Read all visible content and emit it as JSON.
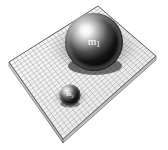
{
  "figure": {
    "background_color": "#ffffff",
    "grid_line_color": "#8a8a8a",
    "grid_fill_color": "#f2f2f2",
    "plane_edge_color": "#4a4a4a",
    "slab_side_color": "#c9c9c9",
    "shadow_color": "#9a9a9a"
  },
  "plane": {
    "name": "spacetime-grid",
    "corners": {
      "top": [
        98,
        6
      ],
      "right": [
        156,
        56
      ],
      "bottom": [
        63,
        139
      ],
      "left": [
        9,
        62
      ]
    },
    "grid_divisions_u": 24,
    "grid_divisions_v": 24,
    "slab_thickness_px": 4
  },
  "bodies": [
    {
      "id": "mass-1",
      "label": "m",
      "subscript": "1",
      "center": [
        94,
        42
      ],
      "radius": 29,
      "highlight": [
        83,
        31
      ],
      "well_radius": 52,
      "well_depth": 18,
      "surface_dark": "#050505",
      "surface_light": "#ffffff",
      "label_color": "#ffffff"
    },
    {
      "id": "mass-2",
      "label": "m",
      "subscript": "2",
      "center": [
        70,
        95
      ],
      "radius": 10.5,
      "highlight": [
        66,
        90
      ],
      "well_radius": 19,
      "well_depth": 6,
      "surface_dark": "#070707",
      "surface_light": "#f6f6f6",
      "label_color": "#ffffff"
    }
  ],
  "chart_data": {
    "type": "diagram",
    "xlabel": "",
    "ylabel": "",
    "annotations": [
      "m1",
      "m2"
    ]
  }
}
